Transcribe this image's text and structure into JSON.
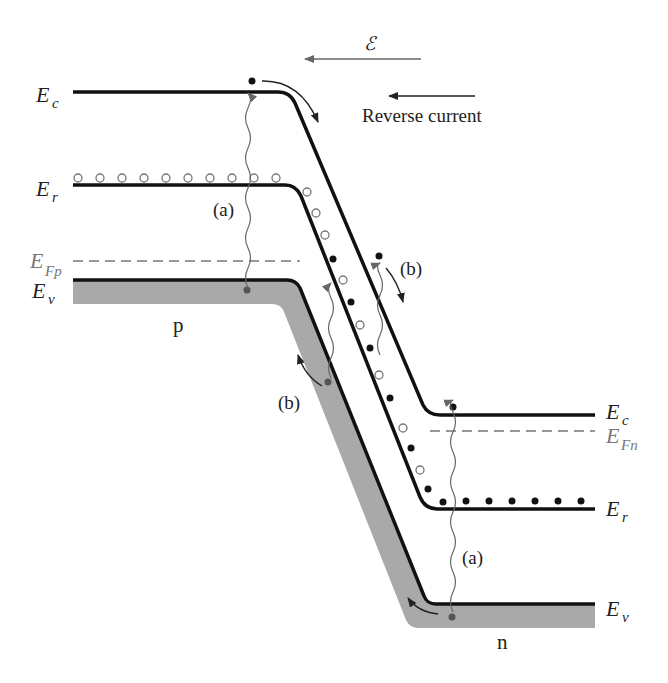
{
  "figure": {
    "type": "band-diagram",
    "colors": {
      "band_line": "#111111",
      "shading": "#a9a9a9",
      "arrow_gray": "#666666",
      "hole_outline": "#777777",
      "electron": "#111111"
    }
  },
  "field": {
    "symbol": "ℰ",
    "label": "Reverse current"
  },
  "left_labels": {
    "ec": {
      "main": "E",
      "sub": "c"
    },
    "er": {
      "main": "E",
      "sub": "r"
    },
    "efp": {
      "main": "E",
      "sub": "Fp"
    },
    "ev": {
      "main": "E",
      "sub": "v"
    }
  },
  "right_labels": {
    "ec": {
      "main": "E",
      "sub": "c"
    },
    "efn": {
      "main": "E",
      "sub": "Fn"
    },
    "er": {
      "main": "E",
      "sub": "r"
    },
    "ev": {
      "main": "E",
      "sub": "v"
    }
  },
  "region_labels": {
    "p": "p",
    "n": "n"
  },
  "process_labels": {
    "a_left": "(a)",
    "a_right": "(a)",
    "b_upper": "(b)",
    "b_lower": "(b)"
  }
}
